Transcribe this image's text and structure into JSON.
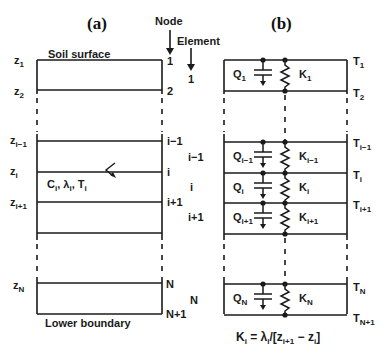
{
  "panel_a": {
    "title": "(a)",
    "top_label": "Soil surface",
    "bottom_label": "Lower boundary",
    "node_header": "Node",
    "element_header": "Element",
    "depth_labels": [
      {
        "base": "z",
        "sub": "1"
      },
      {
        "base": "z",
        "sub": "2"
      },
      {
        "base": "z",
        "sub": "i−1"
      },
      {
        "base": "z",
        "sub": "i"
      },
      {
        "base": "z",
        "sub": "i+1"
      },
      {
        "base": "z",
        "sub": "N"
      }
    ],
    "node_labels": [
      "1",
      "2",
      "i−1",
      "i",
      "i+1",
      "N",
      "N+1"
    ],
    "element_labels": [
      "1",
      "i−1",
      "i",
      "i+1",
      "N"
    ],
    "layer_properties": {
      "c": "C",
      "lambda": "λ",
      "t": "T",
      "sub": "i",
      "sep": ", "
    }
  },
  "panel_b": {
    "title": "(b)",
    "temperature_labels": [
      {
        "base": "T",
        "sub": "1"
      },
      {
        "base": "T",
        "sub": "2"
      },
      {
        "base": "T",
        "sub": "i−1"
      },
      {
        "base": "T",
        "sub": "i"
      },
      {
        "base": "T",
        "sub": "i+1"
      },
      {
        "base": "T",
        "sub": "N"
      },
      {
        "base": "T",
        "sub": "N+1"
      }
    ],
    "capacitance_labels": [
      {
        "base": "Q",
        "sub": "1"
      },
      {
        "base": "Q",
        "sub": "i−1"
      },
      {
        "base": "Q",
        "sub": "i"
      },
      {
        "base": "Q",
        "sub": "i+1"
      },
      {
        "base": "Q",
        "sub": "N"
      }
    ],
    "conductance_labels": [
      {
        "base": "K",
        "sub": "1"
      },
      {
        "base": "K",
        "sub": "i−1"
      },
      {
        "base": "K",
        "sub": "i"
      },
      {
        "base": "K",
        "sub": "i+1"
      },
      {
        "base": "K",
        "sub": "N"
      }
    ],
    "formula": {
      "lhs": "K",
      "lhs_sub": "i",
      "eq": " = ",
      "lam": "λ",
      "lam_sub": "i",
      "mid": "/[z",
      "z1_sub": "i+1",
      "minus": " − z",
      "z2_sub": "i",
      "end": "]"
    }
  }
}
